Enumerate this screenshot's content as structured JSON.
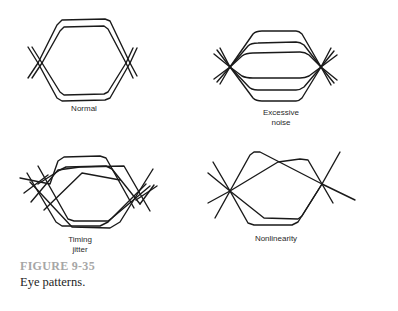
{
  "figure": {
    "number": "FIGURE 9-35",
    "caption": "Eye patterns.",
    "number_color": "#a6a6a6",
    "stroke_color": "#1a1a1a"
  },
  "panels": [
    {
      "id": "normal",
      "label_lines": [
        "Normal"
      ]
    },
    {
      "id": "excessive-noise",
      "label_lines": [
        "Excessive",
        "noise"
      ]
    },
    {
      "id": "timing-jitter",
      "label_lines": [
        "Timing",
        "jitter"
      ]
    },
    {
      "id": "nonlinearity",
      "label_lines": [
        "Nonlinearity"
      ]
    }
  ]
}
